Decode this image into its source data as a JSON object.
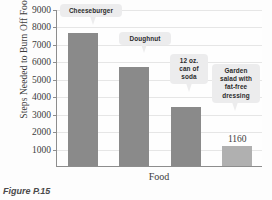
{
  "figure": {
    "caption": "Figure P.15"
  },
  "chart_data": {
    "type": "bar",
    "title": "",
    "xlabel": "Food",
    "ylabel": "Steps Needed to Burn Off Food",
    "categories": [
      "Cheeseburger",
      "Doughnut",
      "12 oz. can of soda",
      "Garden salad with fat-free dressing"
    ],
    "values": [
      7600,
      5700,
      3400,
      1160
    ],
    "ylim": [
      0,
      9000
    ],
    "yticks": [
      1000,
      2000,
      3000,
      4000,
      5000,
      6000,
      7000,
      8000,
      9000
    ],
    "ytick_labels": [
      "1000",
      "2000",
      "3000",
      "4000",
      "5000",
      "6000",
      "7000",
      "8000",
      "9000"
    ],
    "grid": true,
    "legend": "none",
    "bar_colors": [
      "#8a8a8a",
      "#8a8a8a",
      "#8a8a8a",
      "#b0b0b0"
    ],
    "data_labels": [
      {
        "index": 3,
        "text": "1160"
      }
    ],
    "annotations": [
      {
        "index": 0,
        "lines": [
          "Cheeseburger"
        ]
      },
      {
        "index": 1,
        "lines": [
          "Doughnut"
        ]
      },
      {
        "index": 2,
        "lines": [
          "12 oz.",
          "can of",
          "soda"
        ]
      },
      {
        "index": 3,
        "lines": [
          "Garden",
          "salad with",
          "fat-free",
          "dressing"
        ]
      }
    ]
  },
  "colors": {
    "bar_dark": "#8a8a8a",
    "bar_light": "#b0b0b0",
    "axis": "#8d8d8d",
    "grid": "#e6e6e6",
    "callout_bg": "#ececed",
    "text": "#3c3c3c"
  }
}
